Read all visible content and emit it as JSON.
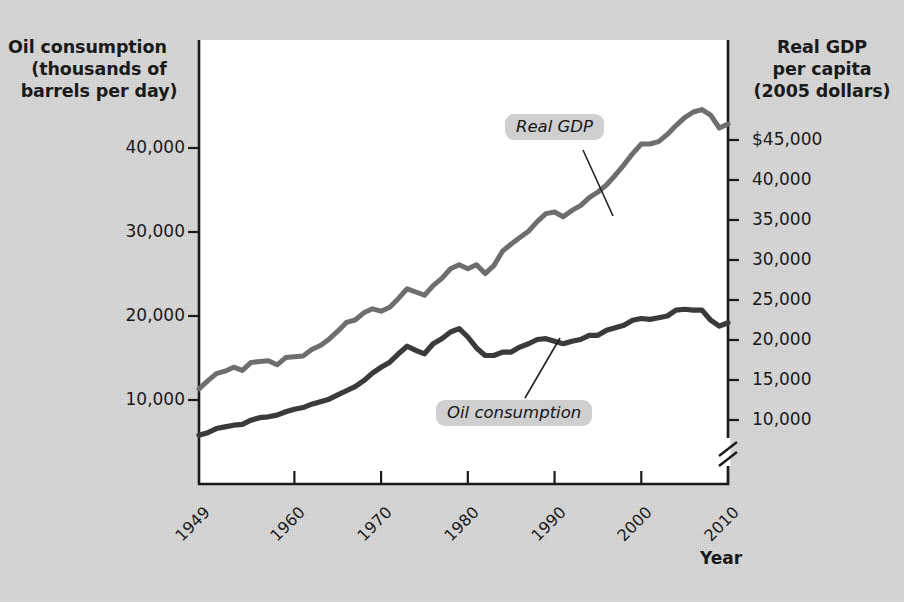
{
  "axes": {
    "left_title_lines": [
      "Oil consumption",
      "(thousands of",
      "barrels per day)"
    ],
    "right_title_lines": [
      "Real GDP",
      "per capita",
      "(2005 dollars)"
    ],
    "x_title": "Year",
    "left_ticks": [
      "40,000",
      "30,000",
      "20,000",
      "10,000"
    ],
    "right_ticks": [
      "$45,000",
      "40,000",
      "35,000",
      "30,000",
      "25,000",
      "20,000",
      "15,000",
      "10,000"
    ],
    "x_ticks": [
      "1949",
      "1960",
      "1970",
      "1980",
      "1990",
      "2000",
      "2010"
    ]
  },
  "annotations": {
    "gdp_label": "Real GDP",
    "oil_label": "Oil consumption"
  },
  "colors": {
    "background": "#d8d8d8",
    "plot_background": "#ffffff",
    "axis": "#1a1a1a",
    "oil_line": "#3a3a3a",
    "gdp_line": "#6e6e6e",
    "label_badge": "#cfcfcf",
    "text": "#1a1a1a"
  },
  "chart_data": {
    "type": "line",
    "title": "",
    "xlabel": "Year",
    "ylabel": "Oil consumption (thousands of barrels per day)",
    "y2label": "Real GDP per capita (2005 dollars)",
    "grid": false,
    "legend": "inline-annotations",
    "xlim": [
      1949,
      2010
    ],
    "ylim": [
      0,
      45000
    ],
    "y2lim": [
      5000,
      47500
    ],
    "y_axis_break": false,
    "y2_axis_break": true,
    "x": [
      1949,
      1950,
      1951,
      1952,
      1953,
      1954,
      1955,
      1956,
      1957,
      1958,
      1959,
      1960,
      1961,
      1962,
      1963,
      1964,
      1965,
      1966,
      1967,
      1968,
      1969,
      1970,
      1971,
      1972,
      1973,
      1974,
      1975,
      1976,
      1977,
      1978,
      1979,
      1980,
      1981,
      1982,
      1983,
      1984,
      1985,
      1986,
      1987,
      1988,
      1989,
      1990,
      1991,
      1992,
      1993,
      1994,
      1995,
      1996,
      1997,
      1998,
      1999,
      2000,
      2001,
      2002,
      2003,
      2004,
      2005,
      2006,
      2007,
      2008,
      2009,
      2010
    ],
    "series": [
      {
        "name": "Oil consumption",
        "axis": "left",
        "units": "thousands of barrels per day",
        "color": "#3a3a3a",
        "values": [
          5800,
          6100,
          6600,
          6800,
          7000,
          7100,
          7600,
          7900,
          8000,
          8200,
          8600,
          8900,
          9100,
          9500,
          9800,
          10100,
          10600,
          11100,
          11600,
          12300,
          13200,
          13900,
          14500,
          15500,
          16400,
          15900,
          15500,
          16700,
          17300,
          18100,
          18500,
          17500,
          16200,
          15300,
          15300,
          15700,
          15700,
          16300,
          16700,
          17200,
          17300,
          17000,
          16700,
          17000,
          17200,
          17700,
          17700,
          18300,
          18600,
          18900,
          19500,
          19700,
          19600,
          19800,
          20000,
          20700,
          20800,
          20700,
          20700,
          19500,
          18800,
          19200
        ]
      },
      {
        "name": "Real GDP per capita",
        "axis": "right",
        "units": "2005 dollars",
        "color": "#6e6e6e",
        "values": [
          13900,
          14900,
          15800,
          16100,
          16600,
          16200,
          17200,
          17300,
          17400,
          16900,
          17800,
          17900,
          18000,
          18800,
          19300,
          20100,
          21100,
          22200,
          22500,
          23400,
          23900,
          23600,
          24100,
          25200,
          26400,
          26000,
          25600,
          26800,
          27700,
          28900,
          29400,
          28900,
          29400,
          28300,
          29300,
          31100,
          32000,
          32800,
          33600,
          34800,
          35800,
          36000,
          35400,
          36200,
          36800,
          37800,
          38500,
          39400,
          40600,
          41900,
          43300,
          44500,
          44500,
          44800,
          45700,
          46800,
          47800,
          48500,
          48800,
          48100,
          46500,
          47000
        ]
      }
    ]
  }
}
